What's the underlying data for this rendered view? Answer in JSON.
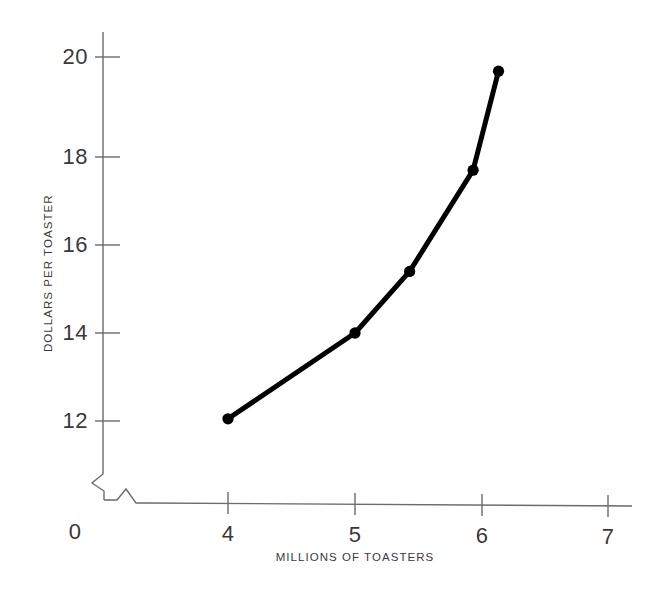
{
  "chart_data": {
    "type": "line",
    "title": "",
    "subtitle": "",
    "xlabel": "MILLIONS OF TOASTERS",
    "ylabel": "DOLLARS PER TOASTER",
    "xlim": [
      0,
      7.35
    ],
    "ylim": [
      11.1,
      20.6
    ],
    "xticks": [
      "0",
      "4",
      "5",
      "6",
      "7"
    ],
    "xtick_values": [
      0,
      4,
      5,
      6,
      7
    ],
    "yticks": [
      "12",
      "14",
      "16",
      "18",
      "20"
    ],
    "ytick_values": [
      12,
      14,
      16,
      18,
      20
    ],
    "grid": false,
    "legend": null,
    "axis_break_x": true,
    "axis_break_y": true,
    "series": [
      {
        "name": "supply",
        "x": [
          4.0,
          5.0,
          5.43,
          5.93,
          6.13
        ],
        "y": [
          12.05,
          14.0,
          15.4,
          17.7,
          19.95
        ],
        "color": "#000000",
        "line_width": 5,
        "marker": "circle",
        "marker_size": 9
      }
    ],
    "annotations": []
  },
  "axis": {
    "line_color": "#6b6b70",
    "tick_color": "#6b6b70"
  }
}
